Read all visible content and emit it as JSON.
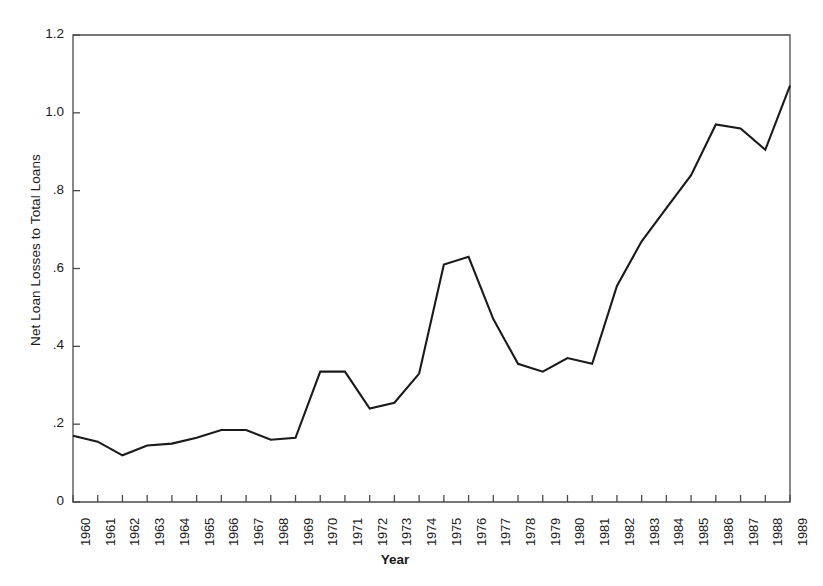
{
  "chart_data": {
    "type": "line",
    "title": "",
    "xlabel": "Year",
    "ylabel": "Net Loan Losses to Total Loans",
    "categories": [
      "1960",
      "1961",
      "1962",
      "1963",
      "1964",
      "1965",
      "1966",
      "1967",
      "1968",
      "1969",
      "1970",
      "1971",
      "1972",
      "1973",
      "1974",
      "1975",
      "1976",
      "1977",
      "1978",
      "1979",
      "1980",
      "1981",
      "1982",
      "1983",
      "1984",
      "1985",
      "1986",
      "1987",
      "1988",
      "1989"
    ],
    "values": [
      0.17,
      0.155,
      0.12,
      0.145,
      0.15,
      0.165,
      0.185,
      0.185,
      0.16,
      0.165,
      0.335,
      0.335,
      0.24,
      0.255,
      0.33,
      0.61,
      0.63,
      0.47,
      0.355,
      0.335,
      0.37,
      0.355,
      0.555,
      0.67,
      0.755,
      0.84,
      0.97,
      0.96,
      0.905,
      1.07
    ],
    "ylim": [
      0,
      1.2
    ],
    "yticks": [
      0,
      0.2,
      0.4,
      0.6,
      0.8,
      1.0,
      1.2
    ],
    "ytick_labels": [
      "0",
      ".2",
      ".4",
      ".6",
      ".8",
      "1.0",
      "1.2"
    ],
    "grid": false,
    "legend": "none",
    "line_color": "#1a1a1a",
    "line_width": 2.1,
    "frame_color": "#4a4a4a",
    "background": "#ffffff",
    "series": [
      {
        "name": "Net Loan Losses to Total Loans",
        "values": [
          0.17,
          0.155,
          0.12,
          0.145,
          0.15,
          0.165,
          0.185,
          0.185,
          0.16,
          0.165,
          0.335,
          0.335,
          0.24,
          0.255,
          0.33,
          0.61,
          0.63,
          0.47,
          0.355,
          0.335,
          0.37,
          0.355,
          0.555,
          0.67,
          0.755,
          0.84,
          0.97,
          0.96,
          0.905,
          1.07
        ]
      }
    ],
    "points": [
      {
        "x": "1960",
        "y": 0.17
      },
      {
        "x": "1961",
        "y": 0.155
      },
      {
        "x": "1962",
        "y": 0.12
      },
      {
        "x": "1963",
        "y": 0.145
      },
      {
        "x": "1964",
        "y": 0.15
      },
      {
        "x": "1965",
        "y": 0.165
      },
      {
        "x": "1966",
        "y": 0.185
      },
      {
        "x": "1967",
        "y": 0.185
      },
      {
        "x": "1968",
        "y": 0.16
      },
      {
        "x": "1969",
        "y": 0.165
      },
      {
        "x": "1970",
        "y": 0.335
      },
      {
        "x": "1971",
        "y": 0.335
      },
      {
        "x": "1972",
        "y": 0.24
      },
      {
        "x": "1973",
        "y": 0.255
      },
      {
        "x": "1974",
        "y": 0.33
      },
      {
        "x": "1975",
        "y": 0.61
      },
      {
        "x": "1976",
        "y": 0.63
      },
      {
        "x": "1977",
        "y": 0.47
      },
      {
        "x": "1978",
        "y": 0.355
      },
      {
        "x": "1979",
        "y": 0.335
      },
      {
        "x": "1980",
        "y": 0.37
      },
      {
        "x": "1981",
        "y": 0.355
      },
      {
        "x": "1982",
        "y": 0.555
      },
      {
        "x": "1983",
        "y": 0.67
      },
      {
        "x": "1984",
        "y": 0.755
      },
      {
        "x": "1985",
        "y": 0.84
      },
      {
        "x": "1986",
        "y": 0.97
      },
      {
        "x": "1987",
        "y": 0.96
      },
      {
        "x": "1988",
        "y": 0.905
      },
      {
        "x": "1989",
        "y": 1.07
      }
    ]
  },
  "plot_geometry": {
    "left": 73,
    "right": 790,
    "top": 35,
    "bottom": 502
  }
}
